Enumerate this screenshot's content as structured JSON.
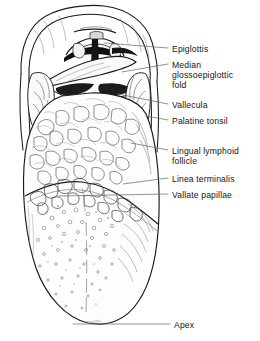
{
  "figure": {
    "type": "anatomical-line-drawing",
    "background_color": "#ffffff",
    "ink_color": "#1a1a1a",
    "label_color": "#151515",
    "leader_color": "#6e6e6e",
    "caption_text": ""
  },
  "labels": [
    {
      "id": "epiglottis",
      "text": "Epiglottis"
    },
    {
      "id": "median-glossoepiglottic-fold",
      "text": "Median\nglossoepiglottic\nfold"
    },
    {
      "id": "vallecula",
      "text": "Vallecula"
    },
    {
      "id": "palatine-tonsil",
      "text": "Palatine tonsil"
    },
    {
      "id": "lingual-lymphoid-follicle",
      "text": "Lingual lymphoid\nfollicle"
    },
    {
      "id": "linea-terminalis",
      "text": "Linea terminalis"
    },
    {
      "id": "vallate-papillae",
      "text": "Vallate papillae"
    },
    {
      "id": "apex",
      "text": "Apex"
    }
  ]
}
